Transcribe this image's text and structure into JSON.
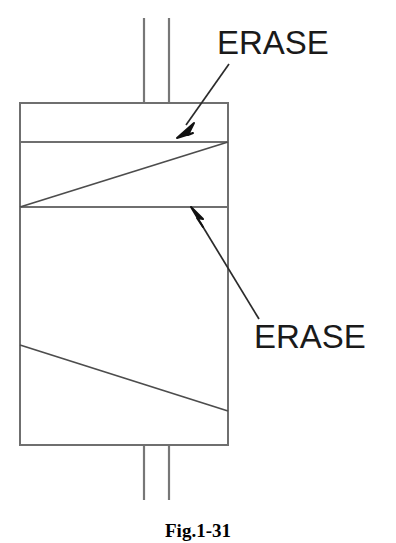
{
  "figure": {
    "caption": "Fig.1-31",
    "background_color": "#ffffff",
    "line_color": "#555555",
    "annotation_color": "#1a1a1a"
  },
  "annotations": [
    {
      "id": "erase-top",
      "label": "ERASE",
      "target": "upper-shaded-band"
    },
    {
      "id": "erase-bottom",
      "label": "ERASE",
      "target": "middle-divider-line"
    }
  ],
  "diagram": {
    "type": "technical-line-drawing",
    "body": {
      "name": "component-body",
      "x": 20,
      "y": 103,
      "width": 208,
      "height": 342
    },
    "leads": {
      "top": [
        {
          "x": 144,
          "y1": 18,
          "y2": 103
        },
        {
          "x": 169,
          "y1": 18,
          "y2": 103
        }
      ],
      "bottom": [
        {
          "x": 144,
          "y1": 445,
          "y2": 500
        },
        {
          "x": 169,
          "y1": 445,
          "y2": 500
        }
      ]
    },
    "horizontal_dividers": [
      {
        "name": "divider-upper",
        "y": 142,
        "x1": 20,
        "x2": 228
      },
      {
        "name": "divider-middle",
        "y": 207,
        "x1": 20,
        "x2": 228
      }
    ],
    "diagonals": [
      {
        "name": "diagonal-upper",
        "x1": 20,
        "y1": 207,
        "x2": 228,
        "y2": 142
      },
      {
        "name": "diagonal-lower",
        "x1": 20,
        "y1": 345,
        "x2": 228,
        "y2": 411
      }
    ],
    "arrows": [
      {
        "name": "arrow-erase-top",
        "tail_x": 229,
        "tail_y": 64,
        "tip_x": 177,
        "tip_y": 138
      },
      {
        "name": "arrow-erase-bottom",
        "tail_x": 259,
        "tail_y": 319,
        "tip_x": 191,
        "tip_y": 207
      }
    ]
  }
}
